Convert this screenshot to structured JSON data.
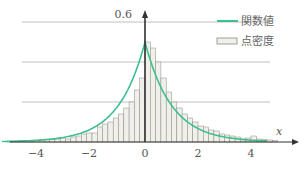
{
  "chart_data": {
    "type": "bar",
    "title": "",
    "xlabel": "x",
    "ylabel": "",
    "xlim": [
      -5.5,
      5.5
    ],
    "ylim": [
      0,
      0.6
    ],
    "y_tick_label": "0.6",
    "x_ticks": [
      -4,
      -2,
      0,
      2,
      4
    ],
    "x_tick_labels": [
      "−4",
      "−2",
      "0",
      "2",
      "4"
    ],
    "gridlines_y": [
      0.2,
      0.4,
      0.6
    ],
    "legend": [
      {
        "label": "関数値",
        "kind": "line",
        "color": "#3dbf8f"
      },
      {
        "label": "点密度",
        "kind": "box",
        "color": "#f0efe9"
      }
    ],
    "function": "0.5*exp(-|x|)",
    "bin_width": 0.2,
    "bins_left_edges": [
      -5.2,
      -5.0,
      -4.8,
      -4.6,
      -4.4,
      -4.2,
      -4.0,
      -3.8,
      -3.6,
      -3.4,
      -3.2,
      -3.0,
      -2.8,
      -2.6,
      -2.4,
      -2.2,
      -2.0,
      -1.8,
      -1.6,
      -1.4,
      -1.2,
      -1.0,
      -0.8,
      -0.6,
      -0.4,
      -0.2,
      0.0,
      0.2,
      0.4,
      0.6,
      0.8,
      1.0,
      1.2,
      1.4,
      1.6,
      1.8,
      2.0,
      2.2,
      2.4,
      2.6,
      2.8,
      3.0,
      3.2,
      3.4,
      3.6,
      3.8,
      4.0,
      4.2,
      4.4,
      4.6,
      4.8
    ],
    "values": [
      0.004,
      0.005,
      0.006,
      0.008,
      0.005,
      0.007,
      0.013,
      0.011,
      0.012,
      0.015,
      0.02,
      0.015,
      0.025,
      0.03,
      0.04,
      0.045,
      0.045,
      0.075,
      0.09,
      0.1,
      0.12,
      0.14,
      0.17,
      0.2,
      0.26,
      0.32,
      0.5,
      0.47,
      0.4,
      0.32,
      0.25,
      0.2,
      0.17,
      0.14,
      0.12,
      0.1,
      0.08,
      0.075,
      0.06,
      0.055,
      0.04,
      0.035,
      0.03,
      0.025,
      0.015,
      0.02,
      0.03,
      0.015,
      0.012,
      0.01,
      0.008
    ]
  },
  "colors": {
    "curve": "#3dbf8f",
    "bar_fill": "#f0efe9",
    "bar_stroke": "#8a8a86",
    "axis": "#333333",
    "grid": "#999999"
  }
}
